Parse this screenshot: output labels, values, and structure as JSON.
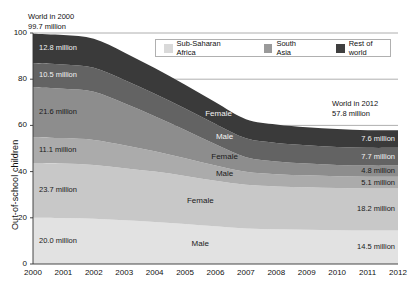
{
  "axes": {
    "ylabel": "Out-of-school children",
    "yticks": [
      0,
      20,
      40,
      60,
      80,
      100
    ],
    "ylim": [
      0,
      100
    ],
    "xticks": [
      "2000",
      "2001",
      "2002",
      "2003",
      "2004",
      "2005",
      "2006",
      "2007",
      "2008",
      "2009",
      "2010",
      "2011",
      "2012"
    ],
    "xlim": [
      2000,
      2012
    ]
  },
  "annotations": {
    "left": {
      "line1": "World in 2000",
      "line2": "99.7 million"
    },
    "right": {
      "line1": "World in 2012",
      "line2": "57.8 million"
    }
  },
  "legend": {
    "position": "top-right-inside",
    "items": [
      {
        "label": "Sub-Saharan Africa",
        "color": "#d9d9d9"
      },
      {
        "label": "South Asia",
        "color": "#9a9a9a"
      },
      {
        "label": "Rest of world",
        "color": "#3f3f3f"
      }
    ]
  },
  "chart_data": {
    "type": "area",
    "stacked": true,
    "title": "",
    "xlabel": "",
    "ylabel": "Out-of-school children",
    "ylim": [
      0,
      100
    ],
    "x": [
      2000,
      2001,
      2002,
      2003,
      2004,
      2005,
      2006,
      2007,
      2008,
      2009,
      2010,
      2011,
      2012
    ],
    "grid": true,
    "totals": {
      "2000": 99.7,
      "2012": 57.8
    },
    "series": [
      {
        "name": "Sub-Saharan Africa Male",
        "region": "Sub-Saharan Africa",
        "sex": "Male",
        "color": "#e2e2e2",
        "start_label": "20.0 million",
        "end_label": "14.5 million",
        "values": [
          20.0,
          19.9,
          19.6,
          18.9,
          18.2,
          17.3,
          16.3,
          15.4,
          15.0,
          14.8,
          14.6,
          14.5,
          14.5
        ]
      },
      {
        "name": "Sub-Saharan Africa Female",
        "region": "Sub-Saharan Africa",
        "sex": "Female",
        "color": "#c8c8c8",
        "start_label": "23.7 million",
        "end_label": "18.2 million",
        "values": [
          23.7,
          23.6,
          23.3,
          22.6,
          21.8,
          20.8,
          19.7,
          18.9,
          18.6,
          18.4,
          18.3,
          18.2,
          18.2
        ]
      },
      {
        "name": "South Asia Male",
        "region": "South Asia",
        "sex": "Male",
        "color": "#ababab",
        "start_label": "11.1 million",
        "end_label": "5.1 million",
        "values": [
          11.1,
          11.0,
          10.8,
          9.9,
          8.8,
          7.7,
          6.6,
          5.6,
          5.3,
          5.2,
          5.1,
          5.1,
          5.1
        ]
      },
      {
        "name": "South Asia Female",
        "region": "South Asia",
        "sex": "Female",
        "color": "#8d8d8d",
        "start_label": "21.6 million",
        "end_label": "4.8 million",
        "values": [
          21.6,
          21.4,
          20.9,
          18.2,
          15.2,
          12.2,
          9.2,
          6.3,
          5.5,
          5.1,
          4.9,
          4.8,
          4.8
        ]
      },
      {
        "name": "Rest of world Male",
        "region": "Rest of world",
        "sex": "Male",
        "color": "#636363",
        "start_label": "10.5 million",
        "end_label": "7.7 million",
        "values": [
          10.5,
          10.5,
          10.4,
          10.1,
          9.7,
          9.3,
          8.8,
          8.2,
          8.0,
          7.9,
          7.8,
          7.7,
          7.7
        ]
      },
      {
        "name": "Rest of world Female",
        "region": "Rest of world",
        "sex": "Female",
        "color": "#3a3a3a",
        "start_label": "12.8 million",
        "end_label": "7.6 million",
        "values": [
          12.8,
          12.7,
          12.5,
          11.9,
          11.1,
          10.3,
          9.4,
          8.3,
          8.0,
          7.8,
          7.7,
          7.6,
          7.6
        ]
      }
    ],
    "band_labels": [
      {
        "text": "Female",
        "series": "Rest of world Female",
        "x": 2006.1
      },
      {
        "text": "Male",
        "series": "Rest of world Male",
        "x": 2006.3
      },
      {
        "text": "Female",
        "series": "South Asia Female",
        "x": 2006.3
      },
      {
        "text": "Male",
        "series": "South Asia Male",
        "x": 2006.3
      },
      {
        "text": "Female",
        "series": "Sub-Saharan Africa Female",
        "x": 2005.5
      },
      {
        "text": "Male",
        "series": "Sub-Saharan Africa Male",
        "x": 2005.5
      }
    ]
  }
}
